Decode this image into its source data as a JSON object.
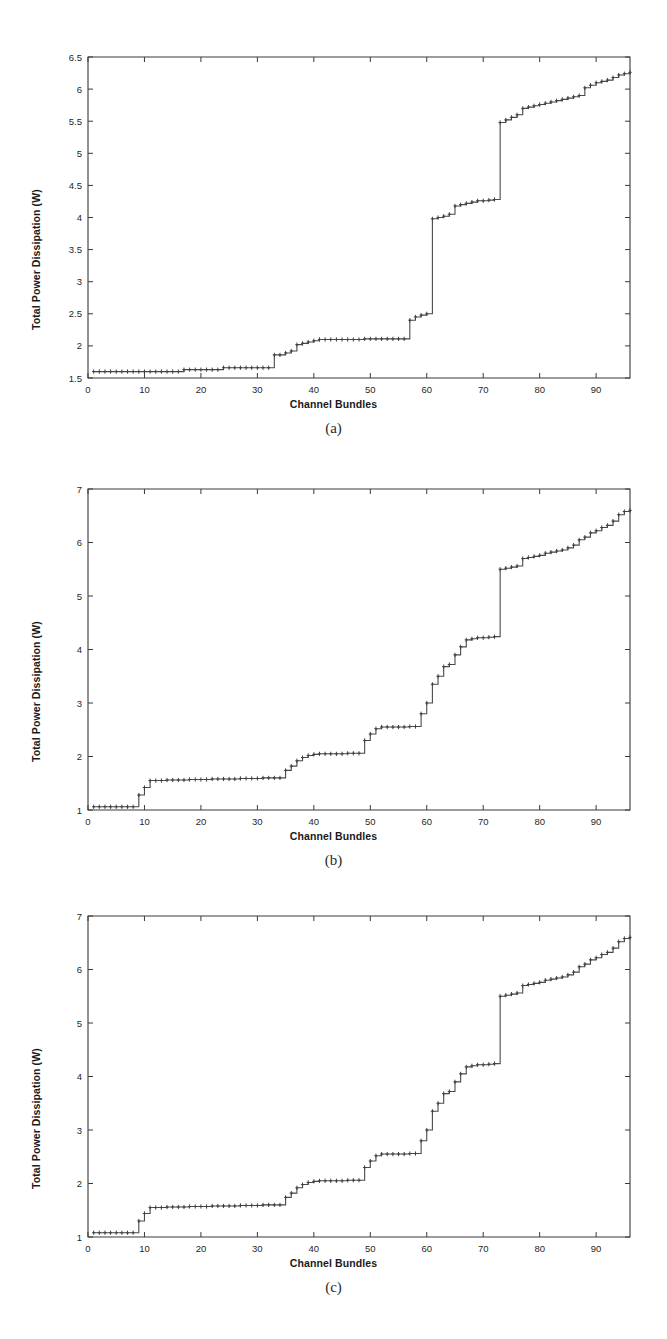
{
  "figure": {
    "background_color": "#ffffff",
    "line_color": "#4a4a4a",
    "axis_color": "#3a3a3a",
    "text_color": "#1a1a1a"
  },
  "panels": [
    {
      "caption": "(a)"
    },
    {
      "caption": "(b)"
    },
    {
      "caption": "(c)"
    }
  ],
  "chart_data": [
    {
      "type": "line",
      "panel": "(a)",
      "title": "",
      "xlabel": "Channel Bundles",
      "ylabel": "Total Power Dissipation (W)",
      "xlim": [
        0,
        96
      ],
      "ylim": [
        1.5,
        6.5
      ],
      "xticks": [
        0,
        10,
        20,
        30,
        40,
        50,
        60,
        70,
        80,
        90
      ],
      "xticklabels": [
        "0",
        "10",
        "20",
        "30",
        "40",
        "50",
        "60",
        "70",
        "80",
        "90"
      ],
      "yticks": [
        1.5,
        2,
        2.5,
        3,
        3.5,
        4,
        4.5,
        5,
        5.5,
        6,
        6.5
      ],
      "yticklabels": [
        "1.5",
        "2",
        "2.5",
        "3",
        "3.5",
        "4",
        "4.5",
        "5",
        "5.5",
        "6",
        "6.5"
      ],
      "grid": false,
      "legend": null,
      "marker": "staircase-steps",
      "x": [
        1,
        2,
        3,
        4,
        5,
        6,
        7,
        8,
        9,
        10,
        11,
        12,
        13,
        14,
        15,
        16,
        17,
        18,
        19,
        20,
        21,
        22,
        23,
        24,
        25,
        26,
        27,
        28,
        29,
        30,
        31,
        32,
        33,
        34,
        35,
        36,
        37,
        38,
        39,
        40,
        41,
        42,
        43,
        44,
        45,
        46,
        47,
        48,
        49,
        50,
        51,
        52,
        53,
        54,
        55,
        56,
        57,
        58,
        59,
        60,
        61,
        62,
        63,
        64,
        65,
        66,
        67,
        68,
        69,
        70,
        71,
        72,
        73,
        74,
        75,
        76,
        77,
        78,
        79,
        80,
        81,
        82,
        83,
        84,
        85,
        86,
        87,
        88,
        89,
        90,
        91,
        92,
        93,
        94,
        95,
        96
      ],
      "y": [
        1.6,
        1.6,
        1.6,
        1.6,
        1.6,
        1.6,
        1.6,
        1.6,
        1.6,
        1.6,
        1.6,
        1.6,
        1.6,
        1.6,
        1.6,
        1.6,
        1.63,
        1.63,
        1.63,
        1.63,
        1.63,
        1.63,
        1.63,
        1.66,
        1.66,
        1.66,
        1.66,
        1.66,
        1.66,
        1.66,
        1.66,
        1.66,
        1.86,
        1.86,
        1.89,
        1.92,
        2.02,
        2.04,
        2.06,
        2.08,
        2.1,
        2.1,
        2.1,
        2.1,
        2.1,
        2.1,
        2.1,
        2.1,
        2.11,
        2.11,
        2.11,
        2.11,
        2.11,
        2.11,
        2.11,
        2.11,
        2.4,
        2.45,
        2.48,
        2.5,
        3.98,
        4.0,
        4.02,
        4.05,
        4.18,
        4.2,
        4.22,
        4.24,
        4.26,
        4.26,
        4.27,
        4.28,
        5.48,
        5.52,
        5.56,
        5.6,
        5.7,
        5.72,
        5.74,
        5.76,
        5.78,
        5.8,
        5.82,
        5.84,
        5.86,
        5.88,
        5.9,
        6.02,
        6.06,
        6.1,
        6.12,
        6.14,
        6.18,
        6.22,
        6.24,
        6.26
      ]
    },
    {
      "type": "line",
      "panel": "(b)",
      "title": "",
      "xlabel": "Channel Bundles",
      "ylabel": "Total Power Dissipation (W)",
      "xlim": [
        0,
        96
      ],
      "ylim": [
        1,
        7
      ],
      "xticks": [
        0,
        10,
        20,
        30,
        40,
        50,
        60,
        70,
        80,
        90
      ],
      "xticklabels": [
        "0",
        "10",
        "20",
        "30",
        "40",
        "50",
        "60",
        "70",
        "80",
        "90"
      ],
      "yticks": [
        1,
        2,
        3,
        4,
        5,
        6,
        7
      ],
      "yticklabels": [
        "1",
        "2",
        "3",
        "4",
        "5",
        "6",
        "7"
      ],
      "grid": false,
      "legend": null,
      "marker": "staircase-steps",
      "x": [
        1,
        2,
        3,
        4,
        5,
        6,
        7,
        8,
        9,
        10,
        11,
        12,
        13,
        14,
        15,
        16,
        17,
        18,
        19,
        20,
        21,
        22,
        23,
        24,
        25,
        26,
        27,
        28,
        29,
        30,
        31,
        32,
        33,
        34,
        35,
        36,
        37,
        38,
        39,
        40,
        41,
        42,
        43,
        44,
        45,
        46,
        47,
        48,
        49,
        50,
        51,
        52,
        53,
        54,
        55,
        56,
        57,
        58,
        59,
        60,
        61,
        62,
        63,
        64,
        65,
        66,
        67,
        68,
        69,
        70,
        71,
        72,
        73,
        74,
        75,
        76,
        77,
        78,
        79,
        80,
        81,
        82,
        83,
        84,
        85,
        86,
        87,
        88,
        89,
        90,
        91,
        92,
        93,
        94,
        95,
        96
      ],
      "y": [
        1.06,
        1.06,
        1.06,
        1.06,
        1.06,
        1.06,
        1.06,
        1.06,
        1.28,
        1.42,
        1.55,
        1.55,
        1.55,
        1.56,
        1.56,
        1.56,
        1.56,
        1.57,
        1.57,
        1.57,
        1.57,
        1.58,
        1.58,
        1.58,
        1.58,
        1.58,
        1.59,
        1.59,
        1.59,
        1.59,
        1.6,
        1.6,
        1.6,
        1.6,
        1.74,
        1.82,
        1.92,
        1.98,
        2.02,
        2.04,
        2.05,
        2.05,
        2.05,
        2.05,
        2.05,
        2.06,
        2.06,
        2.06,
        2.3,
        2.42,
        2.52,
        2.55,
        2.55,
        2.55,
        2.55,
        2.55,
        2.56,
        2.56,
        2.8,
        3.0,
        3.35,
        3.5,
        3.68,
        3.72,
        3.9,
        4.05,
        4.18,
        4.2,
        4.22,
        4.22,
        4.23,
        4.24,
        5.5,
        5.52,
        5.54,
        5.56,
        5.7,
        5.72,
        5.74,
        5.76,
        5.8,
        5.82,
        5.84,
        5.86,
        5.9,
        5.95,
        6.05,
        6.1,
        6.18,
        6.22,
        6.28,
        6.32,
        6.4,
        6.52,
        6.58,
        6.6
      ]
    },
    {
      "type": "line",
      "panel": "(c)",
      "title": "",
      "xlabel": "Channel Bundles",
      "ylabel": "Total Power Dissipation (W)",
      "xlim": [
        0,
        96
      ],
      "ylim": [
        1,
        7
      ],
      "xticks": [
        0,
        10,
        20,
        30,
        40,
        50,
        60,
        70,
        80,
        90
      ],
      "xticklabels": [
        "0",
        "10",
        "20",
        "30",
        "40",
        "50",
        "60",
        "70",
        "80",
        "90"
      ],
      "yticks": [
        1,
        2,
        3,
        4,
        5,
        6,
        7
      ],
      "yticklabels": [
        "1",
        "2",
        "3",
        "4",
        "5",
        "6",
        "7"
      ],
      "grid": false,
      "legend": null,
      "marker": "staircase-steps",
      "x": [
        1,
        2,
        3,
        4,
        5,
        6,
        7,
        8,
        9,
        10,
        11,
        12,
        13,
        14,
        15,
        16,
        17,
        18,
        19,
        20,
        21,
        22,
        23,
        24,
        25,
        26,
        27,
        28,
        29,
        30,
        31,
        32,
        33,
        34,
        35,
        36,
        37,
        38,
        39,
        40,
        41,
        42,
        43,
        44,
        45,
        46,
        47,
        48,
        49,
        50,
        51,
        52,
        53,
        54,
        55,
        56,
        57,
        58,
        59,
        60,
        61,
        62,
        63,
        64,
        65,
        66,
        67,
        68,
        69,
        70,
        71,
        72,
        73,
        74,
        75,
        76,
        77,
        78,
        79,
        80,
        81,
        82,
        83,
        84,
        85,
        86,
        87,
        88,
        89,
        90,
        91,
        92,
        93,
        94,
        95,
        96
      ],
      "y": [
        1.08,
        1.08,
        1.08,
        1.08,
        1.08,
        1.08,
        1.08,
        1.08,
        1.3,
        1.44,
        1.55,
        1.55,
        1.55,
        1.56,
        1.56,
        1.56,
        1.56,
        1.57,
        1.57,
        1.57,
        1.57,
        1.58,
        1.58,
        1.58,
        1.58,
        1.58,
        1.59,
        1.59,
        1.59,
        1.59,
        1.6,
        1.6,
        1.6,
        1.6,
        1.74,
        1.82,
        1.92,
        1.98,
        2.02,
        2.04,
        2.05,
        2.05,
        2.05,
        2.05,
        2.05,
        2.06,
        2.06,
        2.06,
        2.3,
        2.42,
        2.52,
        2.55,
        2.55,
        2.55,
        2.55,
        2.55,
        2.56,
        2.56,
        2.8,
        3.0,
        3.35,
        3.5,
        3.68,
        3.72,
        3.9,
        4.05,
        4.18,
        4.2,
        4.22,
        4.22,
        4.23,
        4.24,
        5.5,
        5.52,
        5.54,
        5.56,
        5.7,
        5.72,
        5.74,
        5.76,
        5.8,
        5.82,
        5.84,
        5.86,
        5.9,
        5.95,
        6.05,
        6.1,
        6.18,
        6.22,
        6.28,
        6.32,
        6.4,
        6.52,
        6.58,
        6.6
      ]
    }
  ]
}
